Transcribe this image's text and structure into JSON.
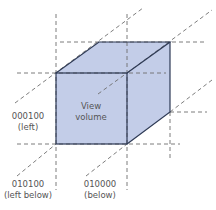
{
  "diagram": {
    "center_label": [
      "View",
      "volume"
    ],
    "colors": {
      "volume_fill": "#c3cde8",
      "volume_edge": "#2e3a55",
      "guide_line": "#6e6e6e",
      "label_text": "#555555"
    },
    "regions": [
      {
        "id": "left",
        "code": "000100",
        "name": "(left)"
      },
      {
        "id": "left-below",
        "code": "010100",
        "name": "(left below)"
      },
      {
        "id": "below",
        "code": "010000",
        "name": "(below)"
      }
    ]
  }
}
